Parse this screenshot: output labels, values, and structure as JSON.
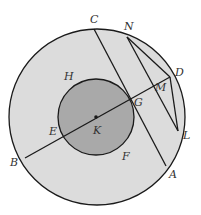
{
  "diagram": {
    "colors": {
      "outer_fill": "#dcdcdc",
      "inner_fill": "#a9a9a9",
      "stroke": "#1a1a1a",
      "background": "#ffffff"
    },
    "labels": {
      "C": "C",
      "N": "N",
      "D": "D",
      "M": "M",
      "H": "H",
      "G": "G",
      "E": "E",
      "K": "K",
      "L": "L",
      "B": "B",
      "F": "F",
      "A": "A"
    }
  }
}
